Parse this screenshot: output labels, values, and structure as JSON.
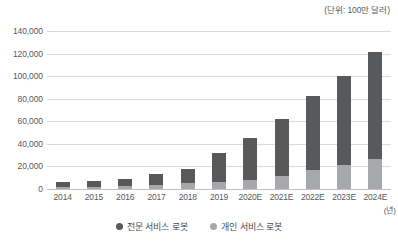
{
  "annotations": {
    "unit_note": "(단위: 100만 달러)",
    "x_axis_unit": "(년)"
  },
  "legend": {
    "items": [
      {
        "label": "전문 서비스 로봇",
        "color": "#58595b",
        "marker": "circle-marker"
      },
      {
        "label": "개인 서비스 로봇",
        "color": "#a6a8ab",
        "marker": "circle-marker"
      }
    ]
  },
  "chart_data": {
    "type": "bar",
    "stacked": true,
    "title": "",
    "subtitle": "",
    "xlabel": "(년)",
    "ylabel": "",
    "unit": "(단위: 100만 달러)",
    "categories": [
      "2014",
      "2015",
      "2016",
      "2017",
      "2018",
      "2019",
      "2020E",
      "2021E",
      "2022E",
      "2023E",
      "2024E"
    ],
    "ylim": [
      0,
      140000
    ],
    "yticks": [
      0,
      20000,
      40000,
      60000,
      80000,
      100000,
      120000,
      140000
    ],
    "ytick_labels": [
      "0",
      "20,000",
      "40,000",
      "60,000",
      "80,000",
      "100,000",
      "120,000",
      "140,000"
    ],
    "grid": true,
    "legend_position": "bottom-center",
    "series": [
      {
        "name": "개인 서비스 로봇",
        "color": "#a6a8ab",
        "values": [
          1700,
          2200,
          2800,
          3800,
          5000,
          6000,
          8000,
          11500,
          17000,
          21500,
          27000
        ]
      },
      {
        "name": "전문 서비스 로봇",
        "color": "#58595b",
        "values": [
          4300,
          5300,
          6200,
          9200,
          13000,
          26000,
          37000,
          50500,
          65000,
          78500,
          94000
        ]
      }
    ],
    "totals": [
      6000,
      7500,
      9000,
      13000,
      18000,
      32000,
      45000,
      62000,
      82000,
      100000,
      121000
    ]
  }
}
